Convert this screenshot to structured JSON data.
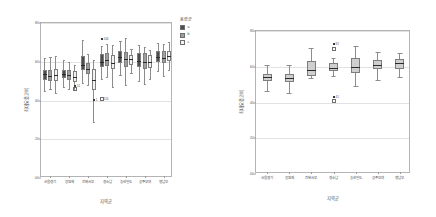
{
  "figure_left": {
    "name": "grouped-boxplot",
    "legend": {
      "title": "용량군",
      "items": [
        {
          "label": "a",
          "color": "#4d4d4d"
        },
        {
          "label": "b",
          "color": "#9e9e9e"
        },
        {
          "label": "c",
          "color": "#f2f2f2"
        }
      ]
    },
    "chart_data": {
      "type": "box",
      "title": "",
      "xlabel": "지역군",
      "ylabel": "최대요중고비",
      "ylim": [
        0,
        80
      ],
      "yticks": [
        0,
        20,
        40,
        60,
        80
      ],
      "ytick_labels": [
        "00",
        "20",
        "40",
        "60",
        "80"
      ],
      "grid": true,
      "legend_position": "right",
      "categories": [
        "서울경기",
        "강원제",
        "전북서부",
        "경소남",
        "농산일도",
        "공주부여",
        "행남부"
      ],
      "series": [
        {
          "name": "a",
          "color": "#4d4d4d",
          "boxes": [
            {
              "category": "서울경기",
              "whisker_low": 45.0,
              "q1": 50.5,
              "median": 53.5,
              "q3": 56.0,
              "whisker_high": 62.0,
              "outliers": []
            },
            {
              "category": "강원제",
              "whisker_low": 47.0,
              "q1": 51.5,
              "median": 53.5,
              "q3": 56.0,
              "whisker_high": 61.0,
              "outliers": []
            },
            {
              "category": "전북서부",
              "whisker_low": 49.0,
              "q1": 56.0,
              "median": 58.5,
              "q3": 63.0,
              "whisker_high": 71.0,
              "outliers": []
            },
            {
              "category": "경소남",
              "whisker_low": 51.0,
              "q1": 57.5,
              "median": 60.0,
              "q3": 64.0,
              "whisker_high": 68.0,
              "outliers": [
                {
                  "value": 71.5,
                  "label": "106"
                },
                {
                  "value": 41.0,
                  "label": "120"
                }
              ]
            },
            {
              "category": "농산일도",
              "whisker_low": 53.0,
              "q1": 59.5,
              "median": 62.5,
              "q3": 65.5,
              "whisker_high": 70.5,
              "outliers": []
            },
            {
              "category": "공주부여",
              "whisker_low": 50.0,
              "q1": 57.5,
              "median": 60.5,
              "q3": 64.5,
              "whisker_high": 68.5,
              "outliers": []
            },
            {
              "category": "행남부",
              "whisker_low": 55.0,
              "q1": 60.0,
              "median": 62.5,
              "q3": 65.5,
              "whisker_high": 69.5,
              "outliers": []
            }
          ]
        },
        {
          "name": "b",
          "color": "#9e9e9e",
          "boxes": [
            {
              "category": "서울경기",
              "whisker_low": 46.0,
              "q1": 50.0,
              "median": 52.5,
              "q3": 55.5,
              "whisker_high": 62.5,
              "outliers": []
            },
            {
              "category": "강원제",
              "whisker_low": 46.0,
              "q1": 50.5,
              "median": 53.0,
              "q3": 55.5,
              "whisker_high": 60.0,
              "outliers": []
            },
            {
              "category": "전북서부",
              "whisker_low": 48.0,
              "q1": 53.5,
              "median": 56.5,
              "q3": 59.5,
              "whisker_high": 64.0,
              "outliers": []
            },
            {
              "category": "경소남",
              "whisker_low": 52.0,
              "q1": 58.0,
              "median": 61.0,
              "q3": 64.5,
              "whisker_high": 69.0,
              "outliers": []
            },
            {
              "category": "농산일도",
              "whisker_low": 48.0,
              "q1": 57.5,
              "median": 61.5,
              "q3": 65.0,
              "whisker_high": 72.5,
              "outliers": []
            },
            {
              "category": "공주부여",
              "whisker_low": 48.5,
              "q1": 56.5,
              "median": 60.0,
              "q3": 64.5,
              "whisker_high": 67.5,
              "outliers": []
            },
            {
              "category": "행남부",
              "whisker_low": 52.5,
              "q1": 59.5,
              "median": 62.0,
              "q3": 65.5,
              "whisker_high": 69.0,
              "outliers": []
            }
          ]
        },
        {
          "name": "c",
          "color": "#f2f2f2",
          "boxes": [
            {
              "category": "서울경기",
              "whisker_low": 44.0,
              "q1": 50.0,
              "median": 53.0,
              "q3": 56.5,
              "whisker_high": 63.0,
              "outliers": []
            },
            {
              "category": "강원제",
              "whisker_low": 45.5,
              "q1": 49.5,
              "median": 52.0,
              "q3": 55.0,
              "whisker_high": 58.5,
              "outliers": [
                {
                  "value": 47.5,
                  "label": "51"
                },
                {
                  "value": 46.0,
                  "label": ""
                }
              ]
            },
            {
              "category": "전북서부",
              "whisker_low": 29.0,
              "q1": 45.5,
              "median": 50.5,
              "q3": 56.5,
              "whisker_high": 61.0,
              "outliers": [
                {
                  "value": 40.5,
                  "label": "1"
                }
              ]
            },
            {
              "category": "경소남",
              "whisker_low": 47.0,
              "q1": 56.5,
              "median": 59.5,
              "q3": 63.5,
              "whisker_high": 68.5,
              "outliers": []
            },
            {
              "category": "농산일도",
              "whisker_low": 54.0,
              "q1": 58.5,
              "median": 61.5,
              "q3": 63.5,
              "whisker_high": 66.5,
              "outliers": []
            },
            {
              "category": "공주부여",
              "whisker_low": 51.0,
              "q1": 57.0,
              "median": 60.0,
              "q3": 63.5,
              "whisker_high": 66.0,
              "outliers": []
            },
            {
              "category": "행남부",
              "whisker_low": 56.0,
              "q1": 60.5,
              "median": 63.0,
              "q3": 65.5,
              "whisker_high": 70.0,
              "outliers": []
            }
          ]
        }
      ]
    }
  },
  "figure_right": {
    "name": "single-boxplot",
    "chart_data": {
      "type": "box",
      "title": "",
      "xlabel": "지역군",
      "ylabel": "최대요중고비",
      "ylim": [
        0,
        80
      ],
      "yticks": [
        0,
        20,
        40,
        60,
        80
      ],
      "ytick_labels": [
        "00",
        "20",
        "40",
        "60",
        "80"
      ],
      "grid": true,
      "legend_position": "none",
      "categories": [
        "서울경기",
        "강원제",
        "전북서부",
        "경소남",
        "농산일도",
        "공주부여",
        "행남부"
      ],
      "box_color": "#cfcfcf",
      "series": [
        {
          "name": "전체",
          "color": "#cfcfcf",
          "boxes": [
            {
              "category": "서울경기",
              "whisker_low": 46.5,
              "q1": 52.0,
              "median": 54.5,
              "q3": 56.0,
              "whisker_high": 61.0,
              "outliers": []
            },
            {
              "category": "강원제",
              "whisker_low": 45.5,
              "q1": 51.5,
              "median": 53.5,
              "q3": 56.0,
              "whisker_high": 61.0,
              "outliers": []
            },
            {
              "category": "전북서부",
              "whisker_low": 53.5,
              "q1": 55.0,
              "median": 58.0,
              "q3": 63.0,
              "whisker_high": 70.5,
              "outliers": []
            },
            {
              "category": "경소남",
              "whisker_low": 55.0,
              "q1": 57.5,
              "median": 59.5,
              "q3": 62.0,
              "whisker_high": 65.0,
              "outliers": [
                {
                  "value": 72.5,
                  "label": "82"
                },
                {
                  "value": 70.0,
                  "label": ""
                },
                {
                  "value": 43.0,
                  "label": "41"
                },
                {
                  "value": 41.0,
                  "label": ""
                }
              ]
            },
            {
              "category": "농산일도",
              "whisker_low": 49.0,
              "q1": 56.5,
              "median": 60.0,
              "q3": 65.0,
              "whisker_high": 71.5,
              "outliers": []
            },
            {
              "category": "공주부여",
              "whisker_low": 52.5,
              "q1": 58.5,
              "median": 61.0,
              "q3": 64.0,
              "whisker_high": 68.0,
              "outliers": []
            },
            {
              "category": "행남부",
              "whisker_low": 54.0,
              "q1": 58.5,
              "median": 62.0,
              "q3": 64.5,
              "whisker_high": 67.5,
              "outliers": []
            }
          ]
        }
      ]
    }
  }
}
